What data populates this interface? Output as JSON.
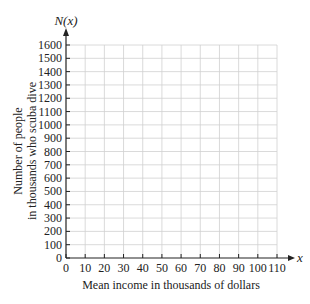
{
  "chart_data": {
    "type": "line",
    "title": "",
    "xlabel": "Mean income in thousands of dollars",
    "ylabel": [
      "Number of people",
      "in thousands who scuba dive"
    ],
    "x_axis_var": "x",
    "y_axis_var": "N(x)",
    "xlim": [
      0,
      110
    ],
    "ylim": [
      0,
      1600
    ],
    "x_ticks": [
      0,
      10,
      20,
      30,
      40,
      50,
      60,
      70,
      80,
      90,
      100,
      110
    ],
    "y_ticks": [
      0,
      100,
      200,
      300,
      400,
      500,
      600,
      700,
      800,
      900,
      1000,
      1100,
      1200,
      1300,
      1400,
      1500,
      1600
    ],
    "grid": true,
    "series": [],
    "legend": null
  },
  "colors": {
    "axis": "#222222",
    "grid": "#d0d0d0",
    "text": "#222222"
  }
}
